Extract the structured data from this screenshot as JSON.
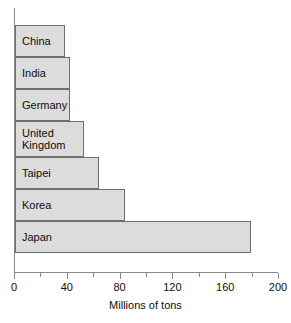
{
  "chart_data": {
    "type": "bar",
    "orientation": "horizontal",
    "title": "",
    "subtitle": "",
    "xlabel": "Millions of tons",
    "ylabel": "",
    "categories": [
      "China",
      "India",
      "Germany",
      "United Kingdom",
      "Taipei",
      "Korea",
      "Japan"
    ],
    "values": [
      38,
      42,
      42,
      52,
      64,
      83,
      179
    ],
    "series": [
      {
        "name": "Steel production",
        "values": [
          38,
          42,
          42,
          52,
          64,
          83,
          179
        ]
      }
    ],
    "xlim": [
      0,
      200
    ],
    "xticks": [
      0,
      20,
      40,
      60,
      80,
      100,
      120,
      140,
      160,
      180,
      200
    ],
    "xtick_labels": [
      "0",
      "",
      "40",
      "",
      "80",
      "",
      "120",
      "",
      "160",
      "",
      "200"
    ],
    "labeled_ticks": [
      0,
      40,
      80,
      120,
      160,
      200
    ],
    "grid": false,
    "legend": false,
    "legend_position": "none",
    "bar_fill_color": "#dcdcdc",
    "bar_border_color": "#6e6e6e",
    "axis_color": "#8a8a8a",
    "text_color": "#0d0d0d",
    "background_color": "#ffffff",
    "category_labels_inside_bars": true
  },
  "axis": {
    "x_title": "Millions of tons",
    "ticks": [
      {
        "value": 0,
        "label": "0",
        "major": true
      },
      {
        "value": 20,
        "label": "",
        "major": false
      },
      {
        "value": 40,
        "label": "40",
        "major": true
      },
      {
        "value": 60,
        "label": "",
        "major": false
      },
      {
        "value": 80,
        "label": "80",
        "major": true
      },
      {
        "value": 100,
        "label": "",
        "major": false
      },
      {
        "value": 120,
        "label": "120",
        "major": true
      },
      {
        "value": 140,
        "label": "",
        "major": false
      },
      {
        "value": 160,
        "label": "160",
        "major": true
      },
      {
        "value": 180,
        "label": "",
        "major": false
      },
      {
        "value": 200,
        "label": "200",
        "major": true
      }
    ]
  },
  "bars": [
    {
      "label": "China",
      "value": 38
    },
    {
      "label": "India",
      "value": 42
    },
    {
      "label": "Germany",
      "value": 42
    },
    {
      "label": "United\nKingdom",
      "value": 52
    },
    {
      "label": "Taipei",
      "value": 64
    },
    {
      "label": "Korea",
      "value": 83
    },
    {
      "label": "Japan",
      "value": 179
    }
  ]
}
